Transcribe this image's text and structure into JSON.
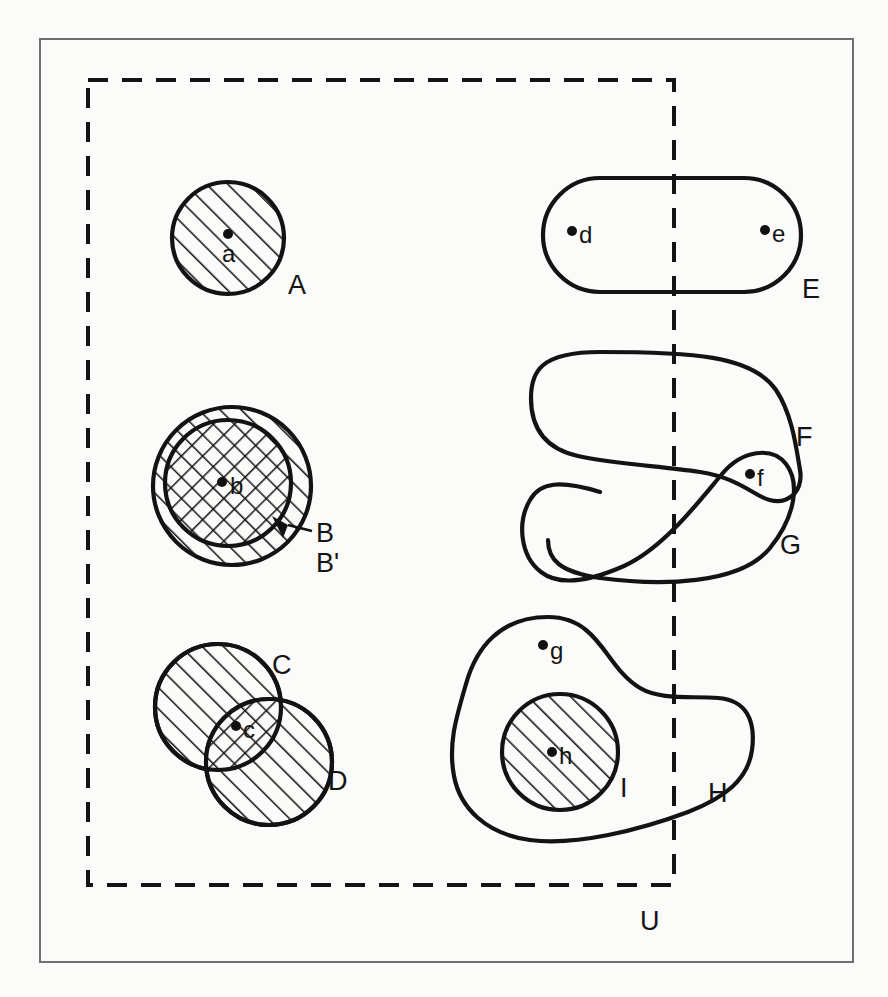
{
  "figure": {
    "background_color": "#fbfbfa",
    "line_color": "#131313",
    "frame_color": "#6f6f70"
  },
  "universe": {
    "label": "U",
    "style": "dashed-rectangle",
    "x": 88,
    "y": 80,
    "width": 586,
    "height": 805,
    "label_x": 640,
    "label_y": 930
  },
  "sets": [
    {
      "id": "A",
      "label": "A",
      "shape": "circle",
      "fill": "diagonal-hatch",
      "cx": 228,
      "cy": 238,
      "r": 56,
      "label_x": 288,
      "label_y": 294
    },
    {
      "id": "B-prime",
      "label": "B'",
      "shape": "circle",
      "fill": "diagonal-hatch",
      "cx": 232,
      "cy": 486,
      "r": 79,
      "label_x": 318,
      "label_y": 570
    },
    {
      "id": "B",
      "label": "B",
      "shape": "circle",
      "fill": "cross-hatch",
      "cx": 228,
      "cy": 483,
      "r": 63,
      "label_x": 318,
      "label_y": 542
    },
    {
      "id": "C",
      "label": "C",
      "shape": "circle",
      "fill": "diagonal-hatch",
      "cx": 218,
      "cy": 707,
      "r": 63,
      "label_x": 276,
      "label_y": 672
    },
    {
      "id": "D",
      "label": "D",
      "shape": "circle",
      "fill": "diagonal-hatch",
      "cx": 269,
      "cy": 762,
      "r": 63,
      "label_x": 330,
      "label_y": 788
    },
    {
      "id": "E",
      "label": "E",
      "shape": "stadium",
      "fill": "none",
      "x": 543,
      "y": 178,
      "width": 258,
      "height": 114,
      "label_x": 806,
      "label_y": 297
    },
    {
      "id": "F",
      "label": "F",
      "shape": "blob",
      "fill": "none",
      "label_x": 800,
      "label_y": 444
    },
    {
      "id": "G",
      "label": "G",
      "shape": "blob",
      "fill": "none",
      "label_x": 784,
      "label_y": 553
    },
    {
      "id": "H",
      "label": "H",
      "shape": "blob",
      "fill": "none",
      "label_x": 712,
      "label_y": 800
    },
    {
      "id": "I",
      "label": "I",
      "shape": "circle",
      "fill": "diagonal-hatch",
      "cx": 560,
      "cy": 752,
      "r": 58,
      "label_x": 622,
      "label_y": 795
    }
  ],
  "points": [
    {
      "id": "a",
      "label": "a",
      "x": 228,
      "y": 234,
      "label_x": 222,
      "label_y": 260,
      "in_sets": [
        "A"
      ]
    },
    {
      "id": "b",
      "label": "b",
      "x": 222,
      "y": 482,
      "label_x": 230,
      "label_y": 496,
      "in_sets": [
        "B",
        "B'"
      ]
    },
    {
      "id": "c",
      "label": "c",
      "x": 236,
      "y": 726,
      "label_x": 243,
      "label_y": 740,
      "in_sets": [
        "C",
        "D"
      ]
    },
    {
      "id": "d",
      "label": "d",
      "x": 572,
      "y": 231,
      "label_x": 579,
      "label_y": 245,
      "in_sets": [
        "E"
      ]
    },
    {
      "id": "e",
      "label": "e",
      "x": 765,
      "y": 230,
      "label_x": 772,
      "label_y": 244,
      "in_sets": [
        "E"
      ]
    },
    {
      "id": "f",
      "label": "f",
      "x": 750,
      "y": 474,
      "label_x": 757,
      "label_y": 488,
      "in_sets": [
        "F",
        "G"
      ]
    },
    {
      "id": "g",
      "label": "g",
      "x": 543,
      "y": 645,
      "label_x": 550,
      "label_y": 661,
      "in_sets": [
        "H"
      ]
    },
    {
      "id": "h",
      "label": "h",
      "x": 552,
      "y": 752,
      "label_x": 559,
      "label_y": 766,
      "in_sets": [
        "H",
        "I"
      ]
    }
  ],
  "annotations": [
    {
      "id": "b-arrow",
      "kind": "arrow-leader",
      "description": "arrow pointing from label B to inner circle B",
      "from_x": 312,
      "from_y": 531,
      "to_x": 278,
      "to_y": 521
    }
  ],
  "frame": {
    "x": 40,
    "y": 39,
    "width": 813,
    "height": 923
  }
}
